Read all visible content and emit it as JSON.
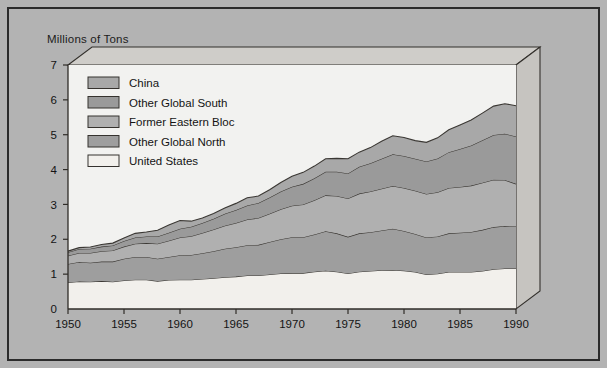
{
  "figure": {
    "background_color": "#b3b3b3",
    "border_color": "#2b2b2b",
    "plot_background": "#f2f2f0"
  },
  "chart_data": {
    "type": "area",
    "title": "",
    "ylabel": "Millions of Tons",
    "xlabel": "",
    "stacked": true,
    "grid": false,
    "legend_position": "top-left",
    "xlim": [
      1950,
      1990
    ],
    "ylim": [
      0,
      7
    ],
    "xticks": [
      1950,
      1955,
      1960,
      1965,
      1970,
      1975,
      1980,
      1985,
      1990
    ],
    "xtick_labels": [
      "1950",
      "1955",
      "1960",
      "1965",
      "1970",
      "1975",
      "1980",
      "1985",
      "1990"
    ],
    "yticks": [
      0,
      1,
      2,
      3,
      4,
      5,
      6,
      7
    ],
    "ytick_labels": [
      "0",
      "1",
      "2",
      "3",
      "4",
      "5",
      "6",
      "7"
    ],
    "x": [
      1950,
      1951,
      1952,
      1953,
      1954,
      1955,
      1956,
      1957,
      1958,
      1959,
      1960,
      1961,
      1962,
      1963,
      1964,
      1965,
      1966,
      1967,
      1968,
      1969,
      1970,
      1971,
      1972,
      1973,
      1974,
      1975,
      1976,
      1977,
      1978,
      1979,
      1980,
      1981,
      1982,
      1983,
      1984,
      1985,
      1986,
      1987,
      1988,
      1989,
      1990
    ],
    "series": [
      {
        "name": "United States",
        "color": "#f2f0ec",
        "values": [
          0.76,
          0.79,
          0.78,
          0.8,
          0.78,
          0.82,
          0.84,
          0.84,
          0.8,
          0.83,
          0.84,
          0.84,
          0.86,
          0.88,
          0.91,
          0.93,
          0.96,
          0.96,
          0.99,
          1.02,
          1.03,
          1.03,
          1.07,
          1.1,
          1.07,
          1.02,
          1.07,
          1.09,
          1.11,
          1.12,
          1.1,
          1.06,
          0.99,
          1.01,
          1.06,
          1.06,
          1.06,
          1.09,
          1.14,
          1.16,
          1.16
        ]
      },
      {
        "name": "Other Global North",
        "color": "#9e9e9e",
        "values": [
          0.53,
          0.56,
          0.55,
          0.56,
          0.58,
          0.62,
          0.65,
          0.65,
          0.64,
          0.66,
          0.7,
          0.71,
          0.74,
          0.78,
          0.82,
          0.84,
          0.87,
          0.88,
          0.93,
          0.98,
          1.03,
          1.03,
          1.07,
          1.13,
          1.1,
          1.05,
          1.1,
          1.11,
          1.14,
          1.18,
          1.14,
          1.09,
          1.06,
          1.07,
          1.11,
          1.13,
          1.15,
          1.18,
          1.21,
          1.22,
          1.21
        ]
      },
      {
        "name": "Former Eastern Bloc",
        "color": "#b0b0b0",
        "values": [
          0.24,
          0.26,
          0.28,
          0.3,
          0.32,
          0.35,
          0.38,
          0.4,
          0.43,
          0.47,
          0.51,
          0.54,
          0.58,
          0.62,
          0.66,
          0.7,
          0.74,
          0.77,
          0.81,
          0.86,
          0.9,
          0.94,
          0.98,
          1.03,
          1.07,
          1.1,
          1.14,
          1.17,
          1.2,
          1.23,
          1.23,
          1.24,
          1.25,
          1.27,
          1.3,
          1.31,
          1.33,
          1.35,
          1.36,
          1.32,
          1.22
        ]
      },
      {
        "name": "Other Global South",
        "color": "#9a9a9a",
        "values": [
          0.1,
          0.11,
          0.12,
          0.13,
          0.14,
          0.16,
          0.18,
          0.19,
          0.21,
          0.23,
          0.25,
          0.27,
          0.29,
          0.31,
          0.34,
          0.37,
          0.4,
          0.43,
          0.47,
          0.51,
          0.55,
          0.59,
          0.63,
          0.68,
          0.7,
          0.72,
          0.77,
          0.81,
          0.86,
          0.91,
          0.92,
          0.92,
          0.93,
          0.97,
          1.03,
          1.09,
          1.15,
          1.22,
          1.28,
          1.33,
          1.36
        ]
      },
      {
        "name": "China",
        "color": "#a8a8a8",
        "values": [
          0.03,
          0.04,
          0.05,
          0.06,
          0.07,
          0.09,
          0.12,
          0.13,
          0.18,
          0.22,
          0.24,
          0.16,
          0.14,
          0.15,
          0.17,
          0.19,
          0.22,
          0.2,
          0.22,
          0.26,
          0.3,
          0.33,
          0.35,
          0.37,
          0.38,
          0.42,
          0.42,
          0.45,
          0.5,
          0.53,
          0.53,
          0.52,
          0.55,
          0.59,
          0.64,
          0.69,
          0.73,
          0.78,
          0.83,
          0.86,
          0.88
        ]
      }
    ]
  }
}
